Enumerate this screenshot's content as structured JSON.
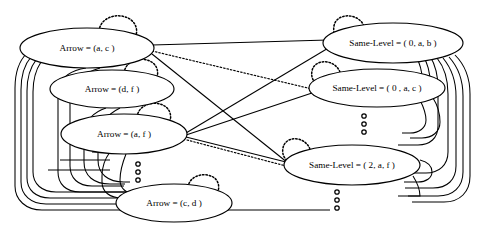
{
  "diagram": {
    "background_color": "#ffffff",
    "stroke_color": "#000000",
    "width": 492,
    "height": 237,
    "nodes": [
      {
        "id": "arrow_ac",
        "label": "Arrow = (a, c )",
        "group": "arrow",
        "cx": 87,
        "cy": 48,
        "rx": 67,
        "ry": 20,
        "self_loop": true
      },
      {
        "id": "arrow_df",
        "label": "Arrow = (d, f )",
        "group": "arrow",
        "cx": 112,
        "cy": 89,
        "rx": 62,
        "ry": 19,
        "self_loop": true
      },
      {
        "id": "arrow_af",
        "label": "Arrow = (a, f )",
        "group": "arrow",
        "cx": 124,
        "cy": 134,
        "rx": 63,
        "ry": 20,
        "self_loop": true
      },
      {
        "id": "arrow_cd",
        "label": "Arrow = (c, d )",
        "group": "arrow",
        "cx": 174,
        "cy": 203,
        "rx": 58,
        "ry": 19,
        "self_loop": true
      },
      {
        "id": "same_0ab",
        "label": "Same-Level = ( 0, a, b )",
        "group": "same-level",
        "cx": 393,
        "cy": 43,
        "rx": 70,
        "ry": 20,
        "self_loop": true
      },
      {
        "id": "same_0ac",
        "label": "Same-Level = ( 0 , a, c )",
        "group": "same-level",
        "cx": 377,
        "cy": 88,
        "rx": 68,
        "ry": 19,
        "self_loop": true
      },
      {
        "id": "same_2af",
        "label": "Same-Level = ( 2, a, f )",
        "group": "same-level",
        "cx": 352,
        "cy": 165,
        "rx": 68,
        "ry": 20,
        "self_loop": true
      }
    ],
    "edges": [
      {
        "from": "arrow_ac",
        "to": "same_0ab",
        "style": "solid"
      },
      {
        "from": "arrow_ac",
        "to": "same_0ac",
        "style": "dotted"
      },
      {
        "from": "arrow_ac",
        "to": "same_2af",
        "style": "solid"
      },
      {
        "from": "arrow_af",
        "to": "same_0ab",
        "style": "solid"
      },
      {
        "from": "arrow_af",
        "to": "same_0ac",
        "style": "solid"
      },
      {
        "from": "arrow_af",
        "to": "same_2af",
        "style": "solid"
      },
      {
        "from": "arrow_af",
        "to": "same_2af",
        "style": "dotted"
      }
    ],
    "ellipsis_groups": [
      {
        "id": "ellipsis-arrow-column",
        "cx": 138,
        "cy": 172,
        "dots": 3
      },
      {
        "id": "ellipsis-same-level-upper",
        "cx": 364,
        "cy": 124,
        "dots": 3
      },
      {
        "id": "ellipsis-same-level-lower",
        "cx": 337,
        "cy": 200,
        "dots": 3
      }
    ],
    "legend": {
      "solid_edge_meaning": "solid dependency edge",
      "dotted_edge_meaning": "dotted dependency edge",
      "self_loop_meaning": "dotted self-loop"
    }
  }
}
